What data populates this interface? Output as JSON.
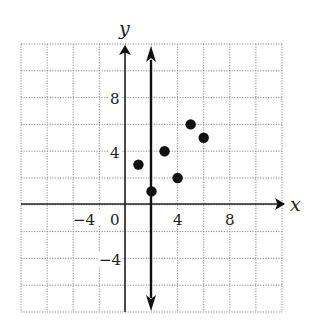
{
  "chart_data": {
    "type": "scatter",
    "title": "",
    "xlabel": "x",
    "ylabel": "y",
    "xlim": [
      -8,
      12
    ],
    "ylim": [
      -8,
      12
    ],
    "grid": true,
    "grid_step": 2,
    "x_tick_labels": [
      "-4",
      "0",
      "4",
      "8"
    ],
    "y_tick_labels": [
      "8",
      "4",
      "-4"
    ],
    "series": [
      {
        "name": "points",
        "x": [
          1,
          2,
          3,
          4,
          5,
          6
        ],
        "y": [
          3,
          1,
          4,
          2,
          6,
          5
        ]
      }
    ],
    "annotations": [
      {
        "type": "vertical_line",
        "x": 2,
        "arrows": "both",
        "description": "vertical line x = 2 (vertical line test)"
      }
    ],
    "legend": null
  },
  "labels": {
    "x_axis": "x",
    "y_axis": "y",
    "ticks": {
      "x_neg4": "−4",
      "origin": "0",
      "x_4": "4",
      "x_8": "8",
      "y_8": "8",
      "y_4": "4",
      "y_neg4": "−4"
    }
  },
  "colors": {
    "ink": "#111111",
    "grid": "#8a8a8a",
    "background": "#ffffff"
  }
}
